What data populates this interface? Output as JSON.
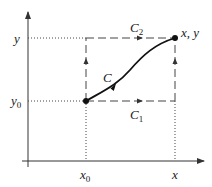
{
  "diagram": {
    "axes": {
      "origin": [
        28,
        161
      ],
      "x_axis_end": 204,
      "y_axis_end": 12
    },
    "points": {
      "start": {
        "px": [
          86,
          101
        ],
        "label": "(x0, y0)"
      },
      "end": {
        "px": [
          175,
          38
        ],
        "label": "x, y"
      }
    },
    "labels": {
      "y_tick": "y",
      "y0_tick_base": "y",
      "y0_tick_sub": "0",
      "x0_tick_base": "x",
      "x0_tick_sub": "0",
      "x_tick": "x",
      "endpoint": "x, y",
      "curve": "C",
      "path1_base": "C",
      "path1_sub": "1",
      "path2_base": "C",
      "path2_sub": "2"
    },
    "paths": [
      {
        "name": "C",
        "style": "solid curve",
        "from": "start",
        "to": "end"
      },
      {
        "name": "C1",
        "style": "dashed",
        "route": "right along y0, then up along x"
      },
      {
        "name": "C2",
        "style": "dashed",
        "route": "up along x0, then right along y"
      }
    ],
    "colors": {
      "line": "#333333",
      "curve": "#111111",
      "text": "#222222",
      "background": "#ffffff"
    }
  }
}
